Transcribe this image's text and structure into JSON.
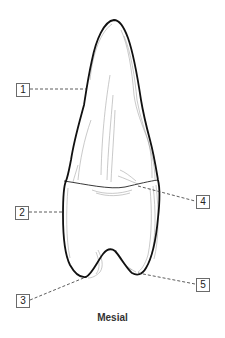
{
  "figure": {
    "view_caption": "Mesial",
    "colors": {
      "outline": "#111111",
      "detail_lines": "#9a9a9a",
      "leader_lines": "#333333",
      "label_border": "#6b6b6b"
    }
  },
  "labels": [
    {
      "id": "1",
      "text": "1",
      "box": {
        "x": 16,
        "y": 83
      },
      "points_to": {
        "x": 86,
        "y": 89
      }
    },
    {
      "id": "2",
      "text": "2",
      "box": {
        "x": 15,
        "y": 206
      },
      "points_to": {
        "x": 64,
        "y": 212
      }
    },
    {
      "id": "3",
      "text": "3",
      "box": {
        "x": 16,
        "y": 294
      },
      "points_to": {
        "x": 86,
        "y": 277
      }
    },
    {
      "id": "4",
      "text": "4",
      "box": {
        "x": 196,
        "y": 195
      },
      "points_to": {
        "x": 138,
        "y": 186
      }
    },
    {
      "id": "5",
      "text": "5",
      "box": {
        "x": 196,
        "y": 278
      },
      "points_to": {
        "x": 138,
        "y": 273
      }
    }
  ]
}
